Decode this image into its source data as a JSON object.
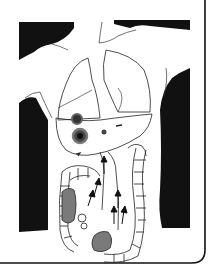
{
  "figure": {
    "colors": {
      "background": "#ffffff",
      "ink": "#111111",
      "shading": "#7a7a7a",
      "lesion": "#333333"
    },
    "elements": [
      {
        "name": "left-shoulder-region",
        "fill": "black"
      },
      {
        "name": "right-shoulder-region",
        "fill": "black"
      },
      {
        "name": "left-lung",
        "fill": "outline"
      },
      {
        "name": "right-lung",
        "fill": "outline"
      },
      {
        "name": "liver-lesions",
        "count": 3
      },
      {
        "name": "colon",
        "fill": "outline"
      },
      {
        "name": "shaded-masses",
        "count": 2
      },
      {
        "name": "flow-arrows",
        "direction": "up"
      }
    ]
  }
}
